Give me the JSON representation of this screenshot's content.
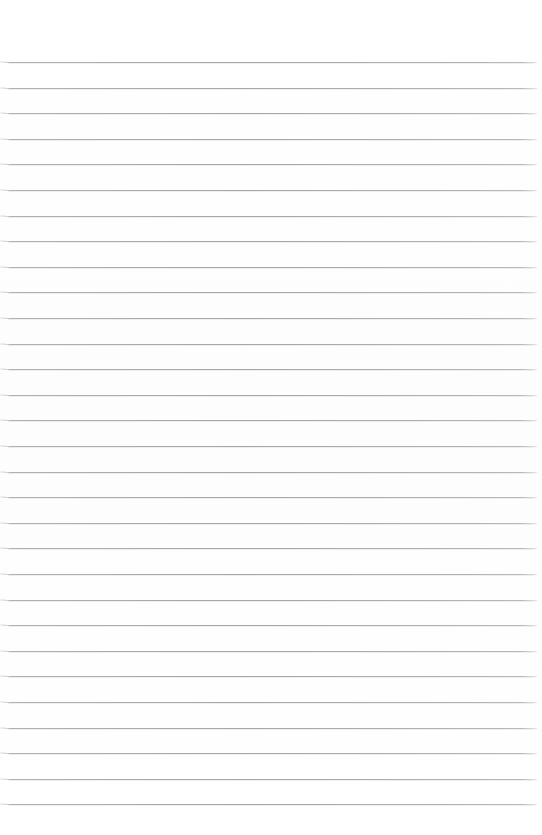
{
  "document": {
    "kind": "lined-paper-scan",
    "title": "Blank ruled notebook page",
    "page_width": 542,
    "page_height": 835,
    "background_color": "#ffffff",
    "paper_tint": "#fdfdfd",
    "content_text": "",
    "has_handwriting": false,
    "has_printed_text": false
  },
  "rules": {
    "count": 30,
    "color": "#a4a6ab",
    "thickness_px": 1,
    "first_line_y": 62,
    "spacing_px": 25.6,
    "left_x": 2,
    "right_x": 537,
    "left_fade_px": 8,
    "right_fade_px": 6
  },
  "margins": {
    "top_margin_px": 62,
    "bottom_margin_px": 26,
    "left_margin_px": 2,
    "right_margin_px": 5,
    "top_area_label": "top blank margin",
    "bottom_area_label": "bottom blank margin"
  }
}
